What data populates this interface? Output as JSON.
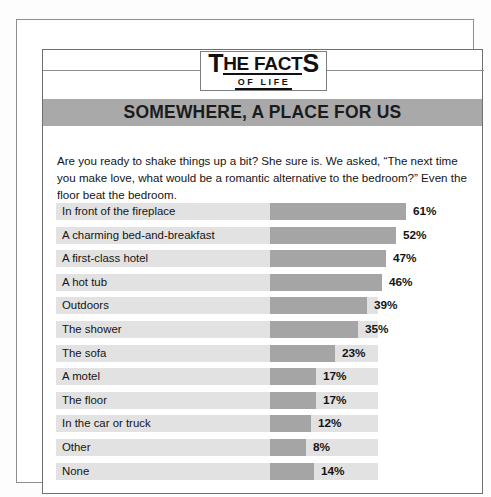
{
  "masthead": {
    "logo_word1": "T",
    "logo_word1_rest": "HE FACT",
    "logo_word1_end": "S",
    "logo_line2": "OF LIFE"
  },
  "banner": {
    "title": "SOMEWHERE, A PLACE FOR US"
  },
  "intro": {
    "text": "Are you ready to shake things up a bit? She sure is. We asked, “The next time you make love, what would be a romantic alternative to the bedroom?” Even the floor beat the bedroom."
  },
  "colors": {
    "band": "#e2e2e2",
    "bar": "#a5a5a5",
    "banner": "#a9a9a9",
    "text": "#141414"
  },
  "chart_data": {
    "type": "bar",
    "title": "SOMEWHERE, A PLACE FOR US",
    "xlabel": "",
    "ylabel": "",
    "orientation": "horizontal",
    "grid": false,
    "legend": "none",
    "xlim": [
      0,
      61
    ],
    "categories": [
      "In front of the fireplace",
      "A charming bed-and-breakfast",
      "A first-class hotel",
      "A hot tub",
      "Outdoors",
      "The shower",
      "The sofa",
      "A motel",
      "The floor",
      "In the car or truck",
      "Other",
      "None"
    ],
    "values": [
      61,
      52,
      47,
      46,
      39,
      35,
      23,
      17,
      17,
      12,
      8,
      14
    ],
    "value_labels": [
      "61%",
      "52%",
      "47%",
      "46%",
      "39%",
      "35%",
      "23%",
      "17%",
      "17%",
      "12%",
      "8%",
      "14%"
    ],
    "bar_px": [
      136,
      126,
      116,
      112,
      97,
      88,
      65,
      46,
      46,
      41,
      36,
      44
    ]
  }
}
